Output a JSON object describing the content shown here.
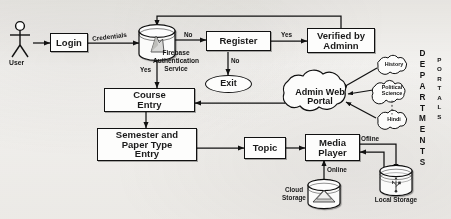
{
  "diagram": {
    "background_color": "#f4f3f1",
    "stroke_color": "#111111"
  },
  "actor": {
    "name": "actor-user",
    "label": "User",
    "icon": "stick-figure-icon"
  },
  "nodes": [
    {
      "id": "login",
      "label": "Login",
      "shape": "process"
    },
    {
      "id": "firebase",
      "label": "",
      "shape": "database",
      "caption": "Firebase\nAuthentication\nService",
      "icon": "firebase-flame-icon"
    },
    {
      "id": "register",
      "label": "Register",
      "shape": "process"
    },
    {
      "id": "verified",
      "label": "Verified by Admin",
      "shape": "process"
    },
    {
      "id": "exit",
      "label": "Exit",
      "shape": "terminator"
    },
    {
      "id": "course",
      "label": "Course Entry",
      "shape": "process"
    },
    {
      "id": "semester",
      "label": "Semester and Paper Type Entry",
      "shape": "process"
    },
    {
      "id": "topic",
      "label": "Topic",
      "shape": "process"
    },
    {
      "id": "media",
      "label": "Media Player",
      "shape": "process"
    },
    {
      "id": "portal",
      "label": "Admin Web Portal",
      "shape": "cloud"
    },
    {
      "id": "history",
      "label": "History",
      "shape": "cloud"
    },
    {
      "id": "polsci",
      "label": "Political Science",
      "shape": "cloud"
    },
    {
      "id": "hindi",
      "label": "Hindi",
      "shape": "cloud"
    },
    {
      "id": "cloudstore",
      "label": "Cloud Storage",
      "shape": "database",
      "icon": "cloud-drive-icon"
    },
    {
      "id": "localstore",
      "label": "Local Storage",
      "shape": "database",
      "icon": "usb-icon"
    }
  ],
  "labels": {
    "login_title": "Login",
    "register_title": "Register",
    "verified_title_line1": "Verified by",
    "verified_title_line2": "Adminn",
    "exit_title": "Exit",
    "course_title_line1": "Course",
    "course_title_line2": "Entry",
    "semester_title_line1": "Semester and",
    "semester_title_line2": "Paper Type",
    "semester_title_line3": "Entry",
    "topic_title": "Topic",
    "media_title_line1": "Media",
    "media_title_line2": "Player",
    "portal_line1": "Admin Web",
    "portal_line2": "Portal",
    "history": "History",
    "polsci_line1": "Political",
    "polsci_line2": "Science",
    "hindi": "Hindi",
    "firebase_line1": "Firebase",
    "firebase_line2": "Authentication",
    "firebase_line3": "Service",
    "cloud_storage_line1": "Cloud",
    "cloud_storage_line2": "Storage",
    "local_storage": "Local Storage",
    "user": "User"
  },
  "edge_labels": [
    {
      "id": "credentials",
      "text": "Credentials",
      "from": "login",
      "to": "firebase"
    },
    {
      "id": "auth_no",
      "text": "No",
      "from": "firebase",
      "to": "register"
    },
    {
      "id": "auth_yes",
      "text": "Yes",
      "from": "firebase",
      "to": "course"
    },
    {
      "id": "reg_yes",
      "text": "Yes",
      "from": "register",
      "to": "verified"
    },
    {
      "id": "reg_no",
      "text": "No",
      "from": "register",
      "to": "exit"
    },
    {
      "id": "offline",
      "text": "Ofline",
      "from": "localstore",
      "to": "media"
    },
    {
      "id": "online",
      "text": "Online",
      "from": "cloudstore",
      "to": "media"
    }
  ],
  "side_columns": {
    "departments": {
      "text": "DEPARTMENTS",
      "letters": [
        "D",
        "E",
        "P",
        "A",
        "R",
        "T",
        "M",
        "E",
        "N",
        "T",
        "S"
      ]
    },
    "portals": {
      "text": "PORTALS",
      "letters": [
        "P",
        "O",
        "R",
        "T",
        "A",
        "L",
        "S"
      ]
    }
  }
}
